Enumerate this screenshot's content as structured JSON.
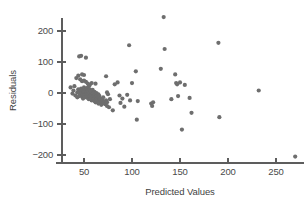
{
  "chart_data": {
    "type": "scatter",
    "title": "",
    "xlabel": "Predicted Values",
    "ylabel": "Residuals",
    "xlim": [
      30,
      282
    ],
    "ylim": [
      -230,
      265
    ],
    "xticks": [
      50,
      100,
      150,
      200,
      250
    ],
    "yticks": [
      200,
      100,
      0,
      -100,
      -200
    ],
    "xtick_labels": [
      "50",
      "100",
      "150",
      "200",
      "250"
    ],
    "ytick_labels": [
      "200",
      "100",
      "0",
      "−100",
      "−200"
    ],
    "grid": false,
    "legend": null,
    "marker_color": "#6e6e6e",
    "marker_size": 4.2,
    "axis_color": "#5d5d5d",
    "points": [
      [
        36,
        18
      ],
      [
        38,
        -2
      ],
      [
        39,
        8
      ],
      [
        40,
        22
      ],
      [
        41,
        -8
      ],
      [
        42,
        48
      ],
      [
        43,
        2
      ],
      [
        43,
        -14
      ],
      [
        44,
        56
      ],
      [
        44,
        12
      ],
      [
        45,
        118
      ],
      [
        45,
        0
      ],
      [
        45,
        -10
      ],
      [
        46,
        44
      ],
      [
        46,
        6
      ],
      [
        46,
        -6
      ],
      [
        47,
        120
      ],
      [
        47,
        -2
      ],
      [
        47,
        14
      ],
      [
        48,
        2
      ],
      [
        48,
        -12
      ],
      [
        48,
        38
      ],
      [
        49,
        8
      ],
      [
        49,
        -4
      ],
      [
        49,
        -18
      ],
      [
        50,
        4
      ],
      [
        50,
        18
      ],
      [
        50,
        -8
      ],
      [
        50,
        40
      ],
      [
        51,
        0
      ],
      [
        51,
        -14
      ],
      [
        51,
        10
      ],
      [
        52,
        114
      ],
      [
        52,
        6
      ],
      [
        52,
        -4
      ],
      [
        52,
        36
      ],
      [
        53,
        2
      ],
      [
        53,
        -10
      ],
      [
        53,
        16
      ],
      [
        54,
        -2
      ],
      [
        54,
        8
      ],
      [
        54,
        -16
      ],
      [
        55,
        4
      ],
      [
        55,
        -6
      ],
      [
        55,
        22
      ],
      [
        55,
        -20
      ],
      [
        56,
        0
      ],
      [
        56,
        -12
      ],
      [
        56,
        12
      ],
      [
        57,
        -4
      ],
      [
        57,
        -18
      ],
      [
        57,
        6
      ],
      [
        58,
        -8
      ],
      [
        58,
        2
      ],
      [
        58,
        -24
      ],
      [
        59,
        -2
      ],
      [
        59,
        -14
      ],
      [
        59,
        10
      ],
      [
        60,
        -6
      ],
      [
        60,
        -20
      ],
      [
        60,
        0
      ],
      [
        61,
        -10
      ],
      [
        61,
        -26
      ],
      [
        61,
        4
      ],
      [
        62,
        -16
      ],
      [
        62,
        -4
      ],
      [
        62,
        -30
      ],
      [
        63,
        -12
      ],
      [
        63,
        -22
      ],
      [
        63,
        0
      ],
      [
        64,
        -8
      ],
      [
        64,
        -28
      ],
      [
        64,
        -18
      ],
      [
        65,
        -14
      ],
      [
        65,
        -34
      ],
      [
        65,
        -4
      ],
      [
        66,
        -24
      ],
      [
        66,
        -10
      ],
      [
        67,
        -30
      ],
      [
        67,
        -18
      ],
      [
        68,
        -26
      ],
      [
        68,
        -38
      ],
      [
        69,
        -22
      ],
      [
        70,
        -32
      ],
      [
        70,
        -14
      ],
      [
        71,
        -28
      ],
      [
        72,
        -36
      ],
      [
        73,
        -24
      ],
      [
        74,
        -42
      ],
      [
        74,
        -30
      ],
      [
        62,
        30
      ],
      [
        58,
        32
      ],
      [
        56,
        26
      ],
      [
        54,
        30
      ],
      [
        50,
        58
      ],
      [
        48,
        60
      ],
      [
        73,
        54
      ],
      [
        74,
        2
      ],
      [
        75,
        -4
      ],
      [
        76,
        -46
      ],
      [
        77,
        -20
      ],
      [
        80,
        -56
      ],
      [
        82,
        28
      ],
      [
        85,
        34
      ],
      [
        87,
        -8
      ],
      [
        88,
        -32
      ],
      [
        90,
        -18
      ],
      [
        92,
        -44
      ],
      [
        95,
        -6
      ],
      [
        97,
        154
      ],
      [
        98,
        -24
      ],
      [
        100,
        32
      ],
      [
        104,
        70
      ],
      [
        105,
        -86
      ],
      [
        106,
        -26
      ],
      [
        120,
        -34
      ],
      [
        121,
        -42
      ],
      [
        122,
        -30
      ],
      [
        130,
        78
      ],
      [
        133,
        245
      ],
      [
        134,
        142
      ],
      [
        141,
        -20
      ],
      [
        145,
        60
      ],
      [
        146,
        32
      ],
      [
        147,
        28
      ],
      [
        148,
        -10
      ],
      [
        150,
        34
      ],
      [
        152,
        -118
      ],
      [
        155,
        26
      ],
      [
        160,
        -16
      ],
      [
        162,
        -64
      ],
      [
        190,
        162
      ],
      [
        191,
        -78
      ],
      [
        232,
        8
      ],
      [
        270,
        -205
      ]
    ]
  }
}
